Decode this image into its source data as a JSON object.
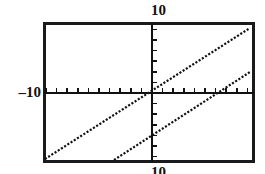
{
  "graph": {
    "labels": {
      "top": "10",
      "left": "–10",
      "bottom": "10"
    },
    "frame": {
      "x": 43,
      "y": 22,
      "width": 212,
      "height": 141,
      "stroke_color": "#1a1a1a",
      "stroke_width": 3
    },
    "axes": {
      "origin_x": 152,
      "origin_y": 93,
      "axis_color": "#111111",
      "axis_width": 2,
      "tick_spacing_px": 10.6,
      "tick_length_px": 5,
      "x_tick_count": 20,
      "y_tick_count": 20
    },
    "background_color": "#ffffff"
  },
  "chart_data": {
    "type": "line",
    "title": "",
    "xlabel": "",
    "ylabel": "",
    "xlim": [
      -10,
      10
    ],
    "ylim": [
      -10,
      10
    ],
    "grid": false,
    "legend": false,
    "axis_tick_labels": {
      "y_max": "10",
      "x_min": "–10",
      "y_min": "10"
    },
    "line_style": "dotted",
    "series": [
      {
        "name": "line-1",
        "style": "dotted",
        "color": "#111111",
        "slope": 1.0,
        "intercept": 0.0,
        "x": [
          -10,
          10
        ],
        "y": [
          -10,
          10
        ],
        "passes_through_origin": true,
        "pixel_endpoints": [
          [
            45,
            159
          ],
          [
            250,
            28
          ]
        ],
        "x_intercept": 0.0,
        "y_intercept": 0.0
      },
      {
        "name": "line-2",
        "style": "dotted",
        "color": "#111111",
        "slope": 1.0,
        "intercept": -5.0,
        "x": [
          -3.5,
          10
        ],
        "y": [
          -8.5,
          5.0
        ],
        "passes_through_origin": false,
        "pixel_endpoints": [
          [
            114,
            160
          ],
          [
            250,
            72
          ]
        ],
        "x_intercept": 5.0,
        "y_intercept": -5.0
      }
    ]
  }
}
